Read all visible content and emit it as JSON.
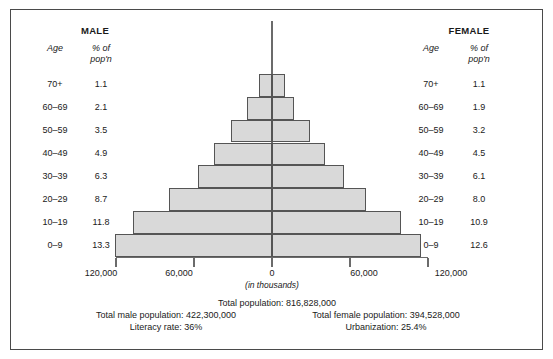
{
  "chart_data": {
    "type": "bar",
    "orientation": "horizontal-diverging",
    "categories": [
      "70+",
      "60–69",
      "50–59",
      "40–49",
      "30–39",
      "20–29",
      "10–19",
      "0–9"
    ],
    "series": [
      {
        "name": "MALE",
        "values": [
          1.1,
          2.1,
          3.5,
          4.9,
          6.3,
          8.7,
          11.8,
          13.3
        ]
      },
      {
        "name": "FEMALE",
        "values": [
          1.1,
          1.9,
          3.2,
          4.5,
          6.1,
          8.0,
          10.9,
          12.6
        ]
      }
    ],
    "xlabel": "(in thousands)",
    "ylabel": "Age",
    "value_unit": "% of pop'n",
    "xlim": [
      -120000,
      120000
    ],
    "xticks": [
      120000,
      60000,
      0,
      60000,
      120000
    ],
    "xtick_labels": [
      "120,000",
      "60,000",
      "0",
      "60,000",
      "120,000"
    ],
    "grid": false,
    "legend": "none",
    "bar_fill": "#d9d9d9",
    "bar_border": "#555555"
  },
  "male": {
    "heading": "MALE",
    "col_age": "Age",
    "col_pct_line1": "% of",
    "col_pct_line2": "pop'n",
    "rows": [
      {
        "age": "70+",
        "pct": "1.1"
      },
      {
        "age": "60–69",
        "pct": "2.1"
      },
      {
        "age": "50–59",
        "pct": "3.5"
      },
      {
        "age": "40–49",
        "pct": "4.9"
      },
      {
        "age": "30–39",
        "pct": "6.3"
      },
      {
        "age": "20–29",
        "pct": "8.7"
      },
      {
        "age": "10–19",
        "pct": "11.8"
      },
      {
        "age": "0–9",
        "pct": "13.3"
      }
    ]
  },
  "female": {
    "heading": "FEMALE",
    "col_age": "Age",
    "col_pct_line1": "% of",
    "col_pct_line2": "pop'n",
    "rows": [
      {
        "age": "70+",
        "pct": "1.1"
      },
      {
        "age": "60–69",
        "pct": "1.9"
      },
      {
        "age": "50–59",
        "pct": "3.2"
      },
      {
        "age": "40–49",
        "pct": "4.5"
      },
      {
        "age": "30–39",
        "pct": "6.1"
      },
      {
        "age": "20–29",
        "pct": "8.0"
      },
      {
        "age": "10–19",
        "pct": "10.9"
      },
      {
        "age": "0–9",
        "pct": "12.6"
      }
    ]
  },
  "axis": {
    "tick_far_left": "120,000",
    "tick_left": "60,000",
    "tick_center": "0",
    "tick_right": "60,000",
    "tick_far_right": "120,000",
    "units": "(in thousands)"
  },
  "footer": {
    "total_population": "Total population: 816,828,000",
    "total_male": "Total male population: 422,300,000",
    "total_female": "Total female population: 394,528,000",
    "literacy": "Literacy rate: 36%",
    "urbanization": "Urbanization: 25.4%"
  }
}
